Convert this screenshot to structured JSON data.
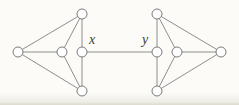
{
  "figure": {
    "width": 239,
    "height": 105,
    "background": "#fcfbf8",
    "colors": {
      "edge": "#8e8e8e",
      "node_fill": "#fefefe",
      "node_stroke": "#7b7b7b",
      "label": "#3c3c3c"
    }
  },
  "graph": {
    "node_radius": 5,
    "nodes": [
      {
        "id": "left-outer",
        "x": 18,
        "y": 52
      },
      {
        "id": "left-top",
        "x": 82,
        "y": 14
      },
      {
        "id": "left-center",
        "x": 62,
        "y": 52
      },
      {
        "id": "x",
        "x": 82,
        "y": 52
      },
      {
        "id": "left-bottom",
        "x": 82,
        "y": 91
      },
      {
        "id": "y",
        "x": 157,
        "y": 52
      },
      {
        "id": "right-top",
        "x": 157,
        "y": 14
      },
      {
        "id": "right-center",
        "x": 177,
        "y": 52
      },
      {
        "id": "right-outer",
        "x": 221,
        "y": 52
      },
      {
        "id": "right-bottom",
        "x": 157,
        "y": 91
      }
    ],
    "edges": [
      [
        "left-outer",
        "left-top"
      ],
      [
        "left-outer",
        "left-center"
      ],
      [
        "left-outer",
        "left-bottom"
      ],
      [
        "left-top",
        "left-center"
      ],
      [
        "left-center",
        "left-bottom"
      ],
      [
        "left-top",
        "x"
      ],
      [
        "x",
        "left-bottom"
      ],
      [
        "x",
        "y"
      ],
      [
        "y",
        "right-top"
      ],
      [
        "y",
        "right-bottom"
      ],
      [
        "right-top",
        "right-center"
      ],
      [
        "right-center",
        "right-bottom"
      ],
      [
        "right-top",
        "right-outer"
      ],
      [
        "right-center",
        "right-outer"
      ],
      [
        "right-bottom",
        "right-outer"
      ]
    ],
    "labels": [
      {
        "text": "x",
        "x": 92,
        "y": 44
      },
      {
        "text": "y",
        "x": 145,
        "y": 44
      }
    ]
  }
}
